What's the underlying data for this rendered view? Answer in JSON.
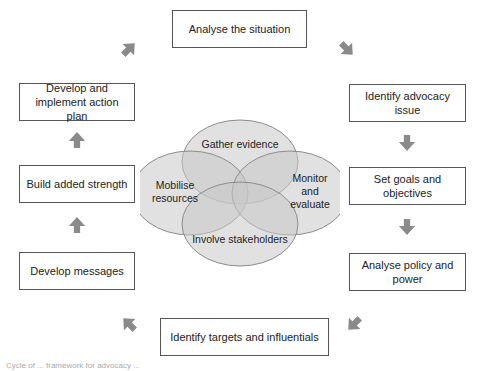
{
  "diagram": {
    "cycle_steps": [
      {
        "id": "analyse-situation",
        "label": "Analyse the situation"
      },
      {
        "id": "identify-issue",
        "label": "Identify advocacy issue"
      },
      {
        "id": "set-goals",
        "label": "Set goals and objectives"
      },
      {
        "id": "analyse-policy",
        "label": "Analyse policy and power"
      },
      {
        "id": "identify-targets",
        "label": "Identify targets and influentials"
      },
      {
        "id": "develop-messages",
        "label": "Develop messages"
      },
      {
        "id": "build-strength",
        "label": "Build added strength"
      },
      {
        "id": "action-plan",
        "label": "Develop and implement action plan"
      }
    ],
    "venn": {
      "top": "Gather evidence",
      "left": "Mobilise resources",
      "right": "Monitor and evaluate",
      "bottom": "Involve stakeholders"
    },
    "colors": {
      "arrow": "#8a8a8a",
      "venn_fill": "#d9d9d9",
      "venn_stroke": "#8c8c8c",
      "box_border": "#555555"
    },
    "caption": "Cycle of ... framework for advocacy ..."
  }
}
